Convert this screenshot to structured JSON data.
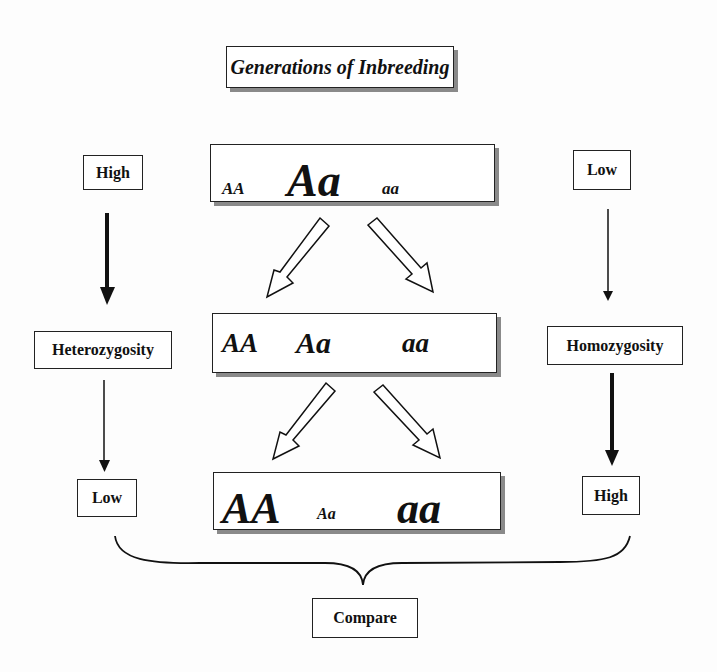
{
  "title": "Generations of Inbreeding",
  "generations": [
    {
      "genotypes": [
        {
          "text": "AA",
          "size": 17,
          "x": 222,
          "y": 180
        },
        {
          "text": "Aa",
          "size": 46,
          "x": 287,
          "y": 158
        },
        {
          "text": "aa",
          "size": 17,
          "x": 382,
          "y": 180
        }
      ]
    },
    {
      "genotypes": [
        {
          "text": "AA",
          "size": 27,
          "x": 222,
          "y": 330
        },
        {
          "text": "Aa",
          "size": 30,
          "x": 296,
          "y": 328
        },
        {
          "text": "aa",
          "size": 27,
          "x": 402,
          "y": 330
        }
      ]
    },
    {
      "genotypes": [
        {
          "text": "AA",
          "size": 44,
          "x": 222,
          "y": 487
        },
        {
          "text": "Aa",
          "size": 16,
          "x": 317,
          "y": 506
        },
        {
          "text": "aa",
          "size": 44,
          "x": 397,
          "y": 487
        }
      ]
    }
  ],
  "left": {
    "top": "High",
    "middle": "Heterozygosity",
    "bottom": "Low"
  },
  "right": {
    "top": "Low",
    "middle": "Homozygosity",
    "bottom": "High"
  },
  "compare": "Compare",
  "colors": {
    "line": "#111111",
    "shadow": "#8a8a8a",
    "background": "#fdfdfd"
  }
}
